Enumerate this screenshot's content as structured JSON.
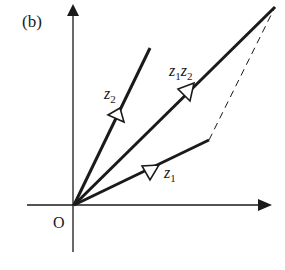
{
  "figure": {
    "panel_label": "(b)",
    "origin_label": "O",
    "vectors": [
      {
        "name": "z1",
        "base": "z",
        "sub": "1",
        "from": [
          74,
          205
        ],
        "to": [
          209,
          140
        ]
      },
      {
        "name": "z2",
        "base": "z",
        "sub": "2",
        "from": [
          74,
          205
        ],
        "to": [
          150,
          48
        ]
      },
      {
        "name": "z1z2",
        "base1": "z",
        "sub1": "1",
        "base2": "z",
        "sub2": "2",
        "from": [
          74,
          205
        ],
        "to": [
          275,
          7
        ]
      }
    ],
    "dashed_line": {
      "from": [
        209,
        140
      ],
      "to": [
        275,
        7
      ]
    },
    "colors": {
      "ink": "#1a1a1a",
      "background": "#ffffff"
    }
  }
}
